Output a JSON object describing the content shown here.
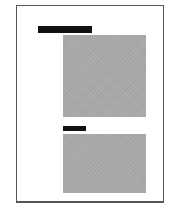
{
  "document": {
    "type": "page-thumbnail",
    "blocks": [
      {
        "kind": "heading-redacted",
        "label": ""
      },
      {
        "kind": "image-placeholder"
      },
      {
        "kind": "caption-redacted",
        "label": ""
      },
      {
        "kind": "image-placeholder"
      }
    ]
  },
  "colors": {
    "border": "#555555",
    "redaction": "#111111",
    "placeholder": "#a9a9a9",
    "background": "#ffffff"
  }
}
